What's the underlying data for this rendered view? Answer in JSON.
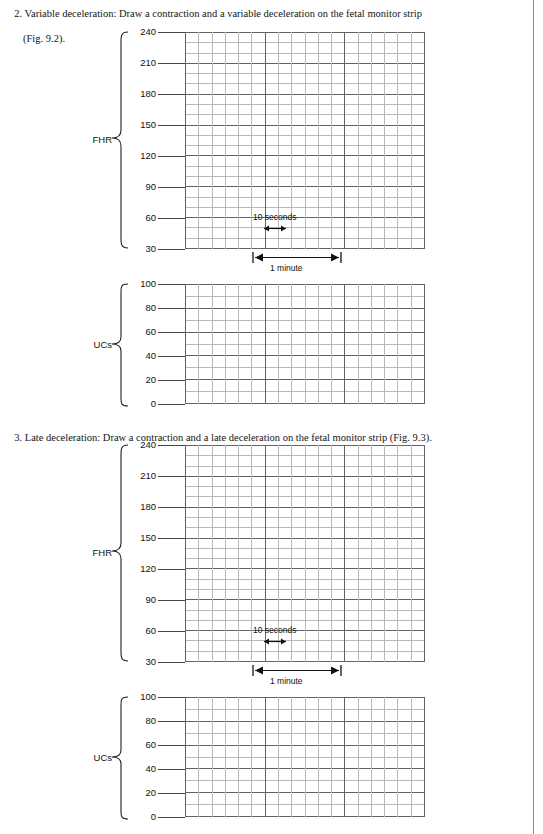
{
  "page": {
    "width": 543,
    "height": 834,
    "background": "#ffffff",
    "rule_color": "#8d8d8d"
  },
  "instructions": [
    {
      "id": "instr-2",
      "number": "2.",
      "line1": "2. Variable deceleration: Draw a contraction and a variable deceleration on the fetal monitor strip",
      "line2": "(Fig. 9.2).",
      "figure_ref": "Fig. 9.2"
    },
    {
      "id": "instr-3",
      "number": "3.",
      "line1": "3. Late deceleration: Draw a contraction and a late deceleration on the fetal monitor strip (Fig. 9.3).",
      "line2": "",
      "figure_ref": "Fig. 9.3"
    }
  ],
  "charts": [
    {
      "id": "fhr-1",
      "axis_label": "FHR",
      "figure": "Fig. 9.2",
      "annotations": {
        "seconds_label": "10 seconds",
        "minute_label": "1 minute"
      }
    },
    {
      "id": "ucs-1",
      "axis_label": "UCs",
      "figure": "Fig. 9.2"
    },
    {
      "id": "fhr-2",
      "axis_label": "FHR",
      "figure": "Fig. 9.3",
      "annotations": {
        "seconds_label": "10 seconds",
        "minute_label": "1 minute"
      }
    },
    {
      "id": "ucs-2",
      "axis_label": "UCs",
      "figure": "Fig. 9.3"
    }
  ],
  "chart_data": [
    {
      "type": "line",
      "id": "fhr-1",
      "title": "",
      "ylabel": "FHR",
      "xlabel": "",
      "ylim": [
        30,
        240
      ],
      "yticks": [
        240,
        210,
        180,
        150,
        120,
        90,
        60,
        30
      ],
      "ytick_labels": [
        "240",
        "210",
        "180",
        "150",
        "120",
        "90",
        "60",
        "30"
      ],
      "minor_y_divisions": 3,
      "x_minor_cells": 18,
      "x_major_every": 6,
      "x_cell_seconds": 10,
      "xlim_seconds": [
        0,
        180
      ],
      "grid": true,
      "series": [],
      "annotations": [
        "10 seconds",
        "1 minute"
      ],
      "note": "Blank fetal-monitor grid for hand drawing a variable deceleration"
    },
    {
      "type": "line",
      "id": "ucs-1",
      "title": "",
      "ylabel": "UCs",
      "xlabel": "",
      "ylim": [
        0,
        100
      ],
      "yticks": [
        100,
        80,
        60,
        40,
        20,
        0
      ],
      "ytick_labels": [
        "100",
        "80",
        "60",
        "40",
        "20",
        "0"
      ],
      "minor_y_divisions": 2,
      "x_minor_cells": 18,
      "x_major_every": 6,
      "x_cell_seconds": 10,
      "xlim_seconds": [
        0,
        180
      ],
      "grid": true,
      "series": [],
      "note": "Blank uterine-contraction grid for hand drawing a contraction"
    },
    {
      "type": "line",
      "id": "fhr-2",
      "title": "",
      "ylabel": "FHR",
      "xlabel": "",
      "ylim": [
        30,
        240
      ],
      "yticks": [
        240,
        210,
        180,
        150,
        120,
        90,
        60,
        30
      ],
      "ytick_labels": [
        "240",
        "210",
        "180",
        "150",
        "120",
        "90",
        "60",
        "30"
      ],
      "minor_y_divisions": 3,
      "x_minor_cells": 18,
      "x_major_every": 6,
      "x_cell_seconds": 10,
      "xlim_seconds": [
        0,
        180
      ],
      "grid": true,
      "series": [],
      "annotations": [
        "10 seconds",
        "1 minute"
      ],
      "note": "Blank fetal-monitor grid for hand drawing a late deceleration"
    },
    {
      "type": "line",
      "id": "ucs-2",
      "title": "",
      "ylabel": "UCs",
      "xlabel": "",
      "ylim": [
        0,
        100
      ],
      "yticks": [
        100,
        80,
        60,
        40,
        20,
        0
      ],
      "ytick_labels": [
        "100",
        "80",
        "60",
        "40",
        "20",
        "0"
      ],
      "minor_y_divisions": 2,
      "x_minor_cells": 18,
      "x_major_every": 6,
      "x_cell_seconds": 10,
      "xlim_seconds": [
        0,
        180
      ],
      "grid": true,
      "series": [],
      "note": "Blank uterine-contraction grid for hand drawing a contraction"
    }
  ],
  "colors": {
    "grid_minor": "#b9b9b9",
    "grid_major": "#636363",
    "frame": "#6e6e6e",
    "text": "#141414"
  }
}
